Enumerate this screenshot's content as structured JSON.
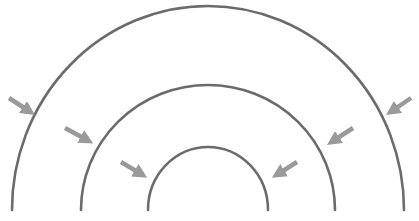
{
  "diagram": {
    "colors": {
      "arc": "#6b6b6b",
      "arrow": "#9a9a9a",
      "background": "#ffffff"
    },
    "arcs": [
      {
        "name": "outer",
        "cx": 208,
        "baseY": 210,
        "rx": 196,
        "ry": 204
      },
      {
        "name": "middle",
        "cx": 208,
        "baseY": 210,
        "rx": 127,
        "ry": 125
      },
      {
        "name": "inner",
        "cx": 208,
        "baseY": 210,
        "rx": 60,
        "ry": 63
      }
    ],
    "arrows": [
      {
        "side": "left",
        "level": "outer",
        "x1": 9,
        "y1": 98,
        "x2": 29,
        "y2": 111
      },
      {
        "side": "left",
        "level": "middle",
        "x1": 65,
        "y1": 128,
        "x2": 87,
        "y2": 140
      },
      {
        "side": "left",
        "level": "inner",
        "x1": 121,
        "y1": 162,
        "x2": 141,
        "y2": 174
      },
      {
        "side": "right",
        "level": "outer",
        "x1": 411,
        "y1": 98,
        "x2": 392,
        "y2": 111
      },
      {
        "side": "right",
        "level": "middle",
        "x1": 353,
        "y1": 128,
        "x2": 333,
        "y2": 141
      },
      {
        "side": "right",
        "level": "inner",
        "x1": 297,
        "y1": 162,
        "x2": 278,
        "y2": 174
      }
    ]
  }
}
